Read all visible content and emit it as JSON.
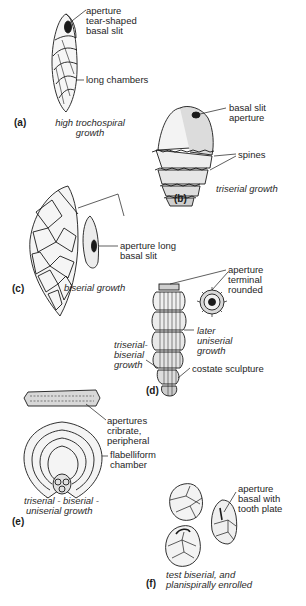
{
  "figure": {
    "panels": [
      {
        "id": "a",
        "label": "(a)",
        "caption_lines": [
          "high trochospiral",
          "growth"
        ],
        "annotations": [
          {
            "lines": [
              "aperture",
              "tear-shaped",
              "basal slit"
            ]
          },
          {
            "lines": [
              "long chambers"
            ]
          }
        ]
      },
      {
        "id": "b",
        "label": "(b)",
        "caption_lines": [
          "triserial growth"
        ],
        "annotations": [
          {
            "lines": [
              "basal slit",
              "aperture"
            ]
          },
          {
            "lines": [
              "spines"
            ]
          }
        ]
      },
      {
        "id": "c",
        "label": "(c)",
        "caption_lines": [
          "biserial growth"
        ],
        "annotations": [
          {
            "lines": [
              "aperture long",
              "basal slit"
            ]
          }
        ]
      },
      {
        "id": "d",
        "label": "(d)",
        "caption_lines": [],
        "annotations": [
          {
            "lines": [
              "aperture",
              "terminal",
              "rounded"
            ]
          },
          {
            "lines": [
              "later",
              "uniserial",
              "growth"
            ],
            "italic": true
          },
          {
            "lines": [
              "triserial-",
              "biserial",
              "growth"
            ],
            "italic": true
          },
          {
            "lines": [
              "costate sculpture"
            ]
          }
        ]
      },
      {
        "id": "e",
        "label": "(e)",
        "caption_lines": [
          "triserial - biserial -",
          "uniserial growth"
        ],
        "annotations": [
          {
            "lines": [
              "apertures",
              "cribrate,",
              "peripheral"
            ]
          },
          {
            "lines": [
              "flabelliform",
              "chamber"
            ]
          }
        ]
      },
      {
        "id": "f",
        "label": "(f)",
        "caption_lines": [
          "test biserial, and",
          "planispirally enrolled"
        ],
        "annotations": [
          {
            "lines": [
              "aperture",
              "basal with",
              "tooth plate"
            ]
          }
        ]
      }
    ]
  },
  "colors": {
    "ink": "#1a1a1a",
    "shade": "#9a9a9a",
    "background": "#ffffff"
  }
}
